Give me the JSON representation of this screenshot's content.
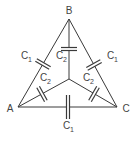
{
  "diagram": {
    "type": "capacitor-network",
    "nodes": [
      {
        "id": "A",
        "label": "A"
      },
      {
        "id": "B",
        "label": "B"
      },
      {
        "id": "C",
        "label": "C"
      }
    ],
    "capacitors": [
      {
        "between": "A-B",
        "label": "C",
        "sub": "1"
      },
      {
        "between": "B-C",
        "label": "C",
        "sub": "1"
      },
      {
        "between": "A-C",
        "label": "C",
        "sub": "1"
      },
      {
        "between": "B-O",
        "label": "C",
        "sub": "2"
      },
      {
        "between": "A-O",
        "label": "C",
        "sub": "2"
      },
      {
        "between": "C-O",
        "label": "C",
        "sub": "2"
      }
    ],
    "colors": {
      "line": "#3a3a3a",
      "text": "#444444",
      "background": "#ffffff"
    }
  }
}
